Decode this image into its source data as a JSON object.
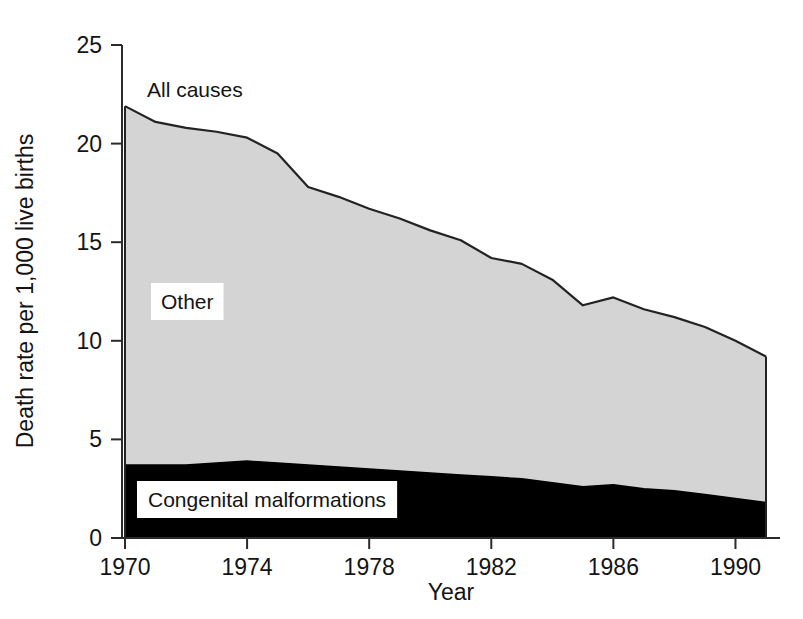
{
  "chart_data": {
    "type": "area",
    "title": "",
    "xlabel": "Year",
    "ylabel": "Death rate per 1,000 live births",
    "xlim": [
      1970,
      1991
    ],
    "ylim": [
      0,
      25
    ],
    "grid": false,
    "legend_position": "inline-annotations",
    "stacked": true,
    "x": [
      1970,
      1971,
      1972,
      1973,
      1974,
      1975,
      1976,
      1977,
      1978,
      1979,
      1980,
      1981,
      1982,
      1983,
      1984,
      1985,
      1986,
      1987,
      1988,
      1989,
      1990,
      1991
    ],
    "xticks": [
      1970,
      1974,
      1978,
      1982,
      1986,
      1990
    ],
    "xtick_labels": [
      "1970",
      "1974",
      "1978",
      "1982",
      "1986",
      "1990"
    ],
    "yticks": [
      0,
      5,
      10,
      15,
      20,
      25
    ],
    "ytick_labels": [
      "0",
      "5",
      "10",
      "15",
      "20",
      "25"
    ],
    "series": [
      {
        "name": "Congenital malformations",
        "color": "#000000",
        "label_annotation": "Congenital malformations",
        "values": [
          3.7,
          3.7,
          3.7,
          3.8,
          3.9,
          3.8,
          3.7,
          3.6,
          3.5,
          3.4,
          3.3,
          3.2,
          3.1,
          3.0,
          2.8,
          2.6,
          2.7,
          2.5,
          2.4,
          2.2,
          2.0,
          1.8
        ]
      },
      {
        "name": "Other",
        "color": "#d4d4d4",
        "label_annotation": "Other",
        "values": [
          18.2,
          17.4,
          17.1,
          16.8,
          16.4,
          15.7,
          14.1,
          13.7,
          13.2,
          12.8,
          12.3,
          11.9,
          11.1,
          10.9,
          10.3,
          9.2,
          9.5,
          9.1,
          8.8,
          8.5,
          8.0,
          7.4
        ]
      }
    ],
    "total_series": {
      "name": "All causes",
      "label_annotation": "All causes",
      "values": [
        21.9,
        21.1,
        20.8,
        20.6,
        20.3,
        19.5,
        17.8,
        17.3,
        16.7,
        16.2,
        15.6,
        15.1,
        14.2,
        13.9,
        13.1,
        11.8,
        12.2,
        11.6,
        11.2,
        10.7,
        10.0,
        9.2
      ]
    }
  },
  "annotations": {
    "all_causes": "All causes",
    "other": "Other",
    "congenital": "Congenital malformations"
  },
  "axes": {
    "x_title": "Year",
    "y_title": "Death rate per 1,000 live births"
  }
}
